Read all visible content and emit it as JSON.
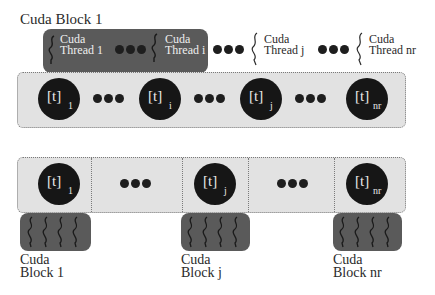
{
  "top": {
    "block_label": "Cuda Block 1",
    "threads": [
      {
        "line1": "Cuda",
        "line2": "Thread 1"
      },
      {
        "line1": "Cuda",
        "line2": "Thread i"
      },
      {
        "line1": "Cuda",
        "line2": "Thread j"
      },
      {
        "line1": "Cuda",
        "line2": "Thread nr"
      }
    ],
    "cells": [
      {
        "label": "[t]",
        "sub": "1"
      },
      {
        "label": "[t]",
        "sub": "i"
      },
      {
        "label": "[t]",
        "sub": "j"
      },
      {
        "label": "[t]",
        "sub": "nr"
      }
    ]
  },
  "bottom": {
    "cells": [
      {
        "label": "[t]",
        "sub": "1"
      },
      {
        "label": "[t]",
        "sub": "j"
      },
      {
        "label": "[t]",
        "sub": "nr"
      }
    ],
    "blocks": [
      {
        "line1": "Cuda",
        "line2": "Block 1"
      },
      {
        "line1": "Cuda",
        "line2": "Block j"
      },
      {
        "line1": "Cuda",
        "line2": "Block nr"
      }
    ]
  },
  "colors": {
    "dark_block": "#5a5a5a",
    "strip": "#e2e2e2",
    "circle": "#161616"
  }
}
